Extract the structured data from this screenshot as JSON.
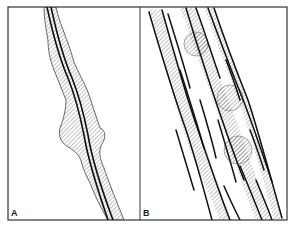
{
  "figure": {
    "panels": [
      {
        "id": "A",
        "label": "A",
        "description": "Single vessel with a double-line core surrounded by an irregular hatched sheath, including a bulge at mid-height"
      },
      {
        "id": "B",
        "label": "B",
        "description": "Bundle of multiple parallel strands with hatched sheaths and circular hatched nodules"
      }
    ],
    "colors": {
      "line": "#1a1a1a",
      "frame": "#333333",
      "hatch": "#555555",
      "background": "#ffffff"
    }
  }
}
